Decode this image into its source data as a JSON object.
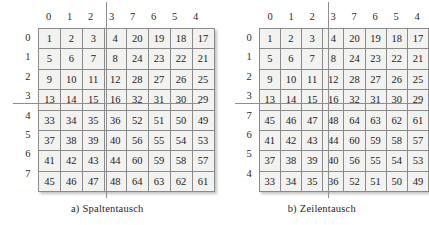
{
  "figure": {
    "columns_label_note": "column indices above each matrix",
    "panels": [
      {
        "id": "panel-a",
        "caption_marker": "a)",
        "caption_text": "Spaltentausch",
        "column_headers": [
          "0",
          "1",
          "2",
          "3",
          "7",
          "6",
          "5",
          "4"
        ],
        "row_headers": [
          "0",
          "1",
          "2",
          "3",
          "4",
          "5",
          "6",
          "7"
        ],
        "cells": [
          [
            "1",
            "2",
            "3",
            "4",
            "20",
            "19",
            "18",
            "17"
          ],
          [
            "5",
            "6",
            "7",
            "8",
            "24",
            "23",
            "22",
            "21"
          ],
          [
            "9",
            "10",
            "11",
            "12",
            "28",
            "27",
            "26",
            "25"
          ],
          [
            "13",
            "14",
            "15",
            "16",
            "32",
            "31",
            "30",
            "29"
          ],
          [
            "33",
            "34",
            "35",
            "36",
            "52",
            "51",
            "50",
            "49"
          ],
          [
            "37",
            "38",
            "39",
            "40",
            "56",
            "55",
            "54",
            "53"
          ],
          [
            "41",
            "42",
            "43",
            "44",
            "60",
            "59",
            "58",
            "57"
          ],
          [
            "45",
            "46",
            "47",
            "48",
            "64",
            "63",
            "62",
            "61"
          ]
        ]
      },
      {
        "id": "panel-b",
        "caption_marker": "b)",
        "caption_text": "Zeilentausch",
        "column_headers": [
          "0",
          "1",
          "2",
          "3",
          "7",
          "6",
          "5",
          "4"
        ],
        "row_headers": [
          "0",
          "1",
          "2",
          "3",
          "7",
          "6",
          "5",
          "4"
        ],
        "cells": [
          [
            "1",
            "2",
            "3",
            "4",
            "20",
            "19",
            "18",
            "17"
          ],
          [
            "5",
            "6",
            "7",
            "8",
            "24",
            "23",
            "22",
            "21"
          ],
          [
            "9",
            "10",
            "11",
            "12",
            "28",
            "27",
            "26",
            "25"
          ],
          [
            "13",
            "14",
            "15",
            "16",
            "32",
            "31",
            "30",
            "29"
          ],
          [
            "45",
            "46",
            "47",
            "48",
            "64",
            "63",
            "62",
            "61"
          ],
          [
            "41",
            "42",
            "43",
            "44",
            "60",
            "59",
            "58",
            "57"
          ],
          [
            "37",
            "38",
            "39",
            "40",
            "56",
            "55",
            "54",
            "53"
          ],
          [
            "33",
            "34",
            "35",
            "36",
            "52",
            "51",
            "50",
            "49"
          ]
        ]
      }
    ],
    "colors": {
      "cell_background": "#f2f2f0",
      "cell_border": "#8a8a8a",
      "outer_border": "#6e6e6e",
      "divider_line": "#8e8e8e",
      "text": "#1a1a1a",
      "page_background": "#ffffff"
    }
  }
}
